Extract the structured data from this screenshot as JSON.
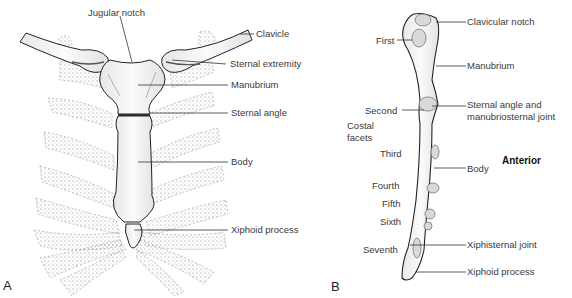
{
  "figure": {
    "panel_a": {
      "letter": "A",
      "labels": {
        "jugular_notch": "Jugular notch",
        "clavicle": "Clavicle",
        "sternal_extremity": "Sternal extremity",
        "manubrium": "Manubrium",
        "sternal_angle": "Sternal angle",
        "body": "Body",
        "xiphoid_process": "Xiphoid process"
      }
    },
    "panel_b": {
      "letter": "B",
      "view": "Anterior",
      "labels": {
        "clavicular_notch": "Clavicular notch",
        "manubrium": "Manubrium",
        "sternal_angle_1": "Sternal angle and",
        "sternal_angle_2": "manubriosternal joint",
        "body": "Body",
        "xiphisternal_joint": "Xiphisternal joint",
        "xiphoid_process": "Xiphoid process",
        "costal_facets_1": "Costal",
        "costal_facets_2": "facets"
      },
      "facets": [
        "First",
        "Second",
        "Third",
        "Fourth",
        "Fifth",
        "Sixth",
        "Seventh"
      ]
    }
  }
}
